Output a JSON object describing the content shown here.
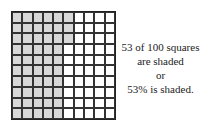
{
  "grid": {
    "rows": 10,
    "cols": 10,
    "shaded_count": 53,
    "shaded_color": "#d8d8d8",
    "fill_order": "column-major from top-left"
  },
  "caption": {
    "line1": "53 of 100 squares",
    "line2": "are shaded",
    "line3": "or",
    "line4": "53% is shaded."
  }
}
